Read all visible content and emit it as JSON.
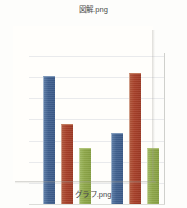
{
  "canvas": {
    "width": 187,
    "height": 208,
    "background": "#fdfdfb"
  },
  "top_caption": {
    "text": "図解.png"
  },
  "bottom_caption": {
    "text": "グラフ.png"
  },
  "colors": {
    "series_blue": "#41618F",
    "series_red": "#A8412A",
    "series_green": "#8FA84A",
    "gridline": "#E9EAEC",
    "frame": "#CFD0CC",
    "caption_text": "#4A4A48"
  },
  "chart_data": {
    "type": "bar",
    "title": "",
    "subtitle": "",
    "xlabel": "",
    "ylabel": "",
    "categories": [
      "1",
      "2"
    ],
    "series": [
      {
        "name": "Series 1",
        "color": "#41618F",
        "values": [
          6.0,
          3.75
        ]
      },
      {
        "name": "Series 2",
        "color": "#A8412A",
        "values": [
          4.35,
          6.15
        ]
      },
      {
        "name": "Series 3",
        "color": "#8FA84A",
        "values": [
          3.2,
          3.2
        ]
      }
    ],
    "ylim": [
      0,
      7
    ],
    "yticks": [
      0,
      1,
      2,
      3,
      4,
      5,
      6,
      7
    ],
    "tick_labels": [],
    "grid": true,
    "grid_axis": "y",
    "legend": false,
    "legend_position": "none",
    "annotations": []
  },
  "plot_geometry": {
    "gridline_count": 7,
    "bar_width_px": 12,
    "group_gap_px": 22,
    "groups": [
      {
        "bars": [
          {
            "series": 0,
            "left_px": 14,
            "height_px": 128
          },
          {
            "series": 1,
            "left_px": 32,
            "height_px": 80
          },
          {
            "series": 2,
            "left_px": 50,
            "height_px": 56
          }
        ]
      },
      {
        "bars": [
          {
            "series": 0,
            "left_px": 82,
            "height_px": 71
          },
          {
            "series": 1,
            "left_px": 100,
            "height_px": 131
          },
          {
            "series": 2,
            "left_px": 118,
            "height_px": 56
          }
        ]
      }
    ]
  }
}
